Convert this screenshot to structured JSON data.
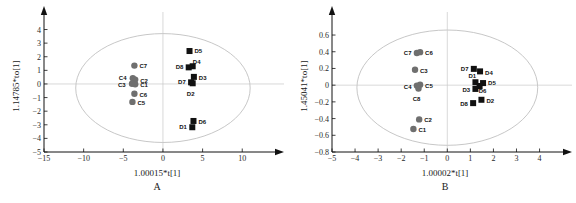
{
  "figure": {
    "faint_header": "",
    "background": "#ffffff"
  },
  "panels": [
    {
      "id": "A",
      "letter": "A",
      "xlabel": "1.00015*t[1]",
      "ylabel": "1.14785*to[1]",
      "xticks": [
        -15,
        -10,
        -5,
        0,
        5,
        10
      ],
      "yticks": [
        4,
        3,
        2,
        1,
        0,
        -1,
        -2,
        -3,
        -4,
        -5
      ],
      "xlim": [
        -15,
        13.5
      ],
      "ylim": [
        -5,
        4.7
      ],
      "ellipse": {
        "cx": 0,
        "cy": -0.3,
        "rx": 11.0,
        "ry": 4.0
      },
      "groups": [
        {
          "name": "C",
          "marker": "circle",
          "color": "#6f6f6f"
        },
        {
          "name": "D",
          "marker": "square",
          "color": "#111111"
        }
      ],
      "points": [
        {
          "label": "C7",
          "x": -3.6,
          "y": 1.35,
          "group": "C",
          "lbl_dx": 5,
          "lbl_dy": 2
        },
        {
          "label": "C4",
          "x": -3.8,
          "y": 0.42,
          "group": "C",
          "lbl_dx": -14,
          "lbl_dy": 2
        },
        {
          "label": "C2",
          "x": -3.5,
          "y": 0.32,
          "group": "C",
          "lbl_dx": 5,
          "lbl_dy": 3
        },
        {
          "label": "C3",
          "x": -3.9,
          "y": 0.02,
          "group": "C",
          "lbl_dx": -14,
          "lbl_dy": 3
        },
        {
          "label": "C1",
          "x": -3.5,
          "y": -0.02,
          "group": "C",
          "lbl_dx": 5,
          "lbl_dy": 3
        },
        {
          "label": "C6",
          "x": -3.6,
          "y": -0.72,
          "group": "C",
          "lbl_dx": 5,
          "lbl_dy": 3
        },
        {
          "label": "C5",
          "x": -3.85,
          "y": -1.32,
          "group": "C",
          "lbl_dx": 5,
          "lbl_dy": 3
        },
        {
          "label": "D5",
          "x": 3.35,
          "y": 2.42,
          "group": "D",
          "lbl_dx": 5,
          "lbl_dy": 2
        },
        {
          "label": "D8",
          "x": 3.25,
          "y": 1.22,
          "group": "D",
          "lbl_dx": -13,
          "lbl_dy": 2
        },
        {
          "label": "D4",
          "x": 3.75,
          "y": 1.3,
          "group": "D",
          "lbl_dx": 4,
          "lbl_dy": -2
        },
        {
          "label": "D3",
          "x": 3.9,
          "y": 0.52,
          "group": "D",
          "lbl_dx": 5,
          "lbl_dy": 3
        },
        {
          "label": "D7",
          "x": 3.55,
          "y": 0.12,
          "group": "D",
          "lbl_dx": -13,
          "lbl_dy": 2
        },
        {
          "label": "D2",
          "x": 3.75,
          "y": 0.05,
          "group": "D",
          "lbl_dx": -2,
          "lbl_dy": 13
        },
        {
          "label": "D6",
          "x": 3.85,
          "y": -2.72,
          "group": "D",
          "lbl_dx": 5,
          "lbl_dy": 3
        },
        {
          "label": "D1",
          "x": 3.7,
          "y": -3.18,
          "group": "D",
          "lbl_dx": -13,
          "lbl_dy": 2
        }
      ]
    },
    {
      "id": "B",
      "letter": "B",
      "xlabel": "1.00002*t[1]",
      "ylabel": "1.45041*to[1]",
      "xticks": [
        -5,
        -4,
        -3,
        -2,
        -1,
        0,
        1,
        2,
        3,
        4
      ],
      "yticks": [
        0.6,
        0.4,
        0.2,
        0,
        -0.2,
        -0.4,
        -0.6,
        -0.8
      ],
      "xlim": [
        -5,
        4.8
      ],
      "ylim": [
        -0.8,
        0.78
      ],
      "ellipse": {
        "cx": 0,
        "cy": -0.03,
        "rx": 3.92,
        "ry": 0.69
      },
      "groups": [
        {
          "name": "C",
          "marker": "circle",
          "color": "#6f6f6f"
        },
        {
          "name": "D",
          "marker": "square",
          "color": "#111111"
        }
      ],
      "points": [
        {
          "label": "C7",
          "x": -1.32,
          "y": 0.385,
          "group": "C",
          "lbl_dx": -13,
          "lbl_dy": 2
        },
        {
          "label": "C6",
          "x": -1.18,
          "y": 0.395,
          "group": "C",
          "lbl_dx": 5,
          "lbl_dy": 3
        },
        {
          "label": "C3",
          "x": -1.4,
          "y": 0.185,
          "group": "C",
          "lbl_dx": 5,
          "lbl_dy": 3
        },
        {
          "label": "C4",
          "x": -1.32,
          "y": -0.005,
          "group": "C",
          "lbl_dx": -13,
          "lbl_dy": 3
        },
        {
          "label": "C5",
          "x": -1.18,
          "y": 0.005,
          "group": "C",
          "lbl_dx": 5,
          "lbl_dy": 3
        },
        {
          "label": "C8",
          "x": -1.25,
          "y": -0.04,
          "group": "C",
          "lbl_dx": -2,
          "lbl_dy": 12
        },
        {
          "label": "C2",
          "x": -1.22,
          "y": -0.41,
          "group": "C",
          "lbl_dx": 5,
          "lbl_dy": 3
        },
        {
          "label": "C1",
          "x": -1.47,
          "y": -0.525,
          "group": "C",
          "lbl_dx": 5,
          "lbl_dy": 3
        },
        {
          "label": "D7",
          "x": 1.15,
          "y": 0.195,
          "group": "D",
          "lbl_dx": -13,
          "lbl_dy": 2
        },
        {
          "label": "D4",
          "x": 1.42,
          "y": 0.165,
          "group": "D",
          "lbl_dx": 5,
          "lbl_dy": 4
        },
        {
          "label": "D1",
          "x": 1.22,
          "y": 0.035,
          "group": "D",
          "lbl_dx": -7,
          "lbl_dy": -4
        },
        {
          "label": "D5",
          "x": 1.55,
          "y": 0.025,
          "group": "D",
          "lbl_dx": 5,
          "lbl_dy": 2
        },
        {
          "label": "D6",
          "x": 1.4,
          "y": -0.01,
          "group": "D",
          "lbl_dx": 3,
          "lbl_dy": 7
        },
        {
          "label": "D3",
          "x": 1.22,
          "y": -0.045,
          "group": "D",
          "lbl_dx": -13,
          "lbl_dy": 3
        },
        {
          "label": "D2",
          "x": 1.48,
          "y": -0.175,
          "group": "D",
          "lbl_dx": 5,
          "lbl_dy": 3
        },
        {
          "label": "D8",
          "x": 1.12,
          "y": -0.215,
          "group": "D",
          "lbl_dx": -13,
          "lbl_dy": 3
        }
      ]
    }
  ],
  "chart_data": {
    "type": "scatter",
    "title": "",
    "subplots": [
      {
        "panel": "A",
        "xlabel": "1.00015*t[1]",
        "ylabel": "1.14785*to[1]",
        "xlim": [
          -15,
          13.5
        ],
        "ylim": [
          -5,
          4.7
        ],
        "grid": false,
        "legend": "none",
        "annotation": "Hotelling T2 ellipse",
        "series": [
          {
            "name": "C group (control)",
            "marker": "circle",
            "color": "#6f6f6f",
            "points": [
              {
                "label": "C1",
                "x": -3.5,
                "y": -0.02
              },
              {
                "label": "C2",
                "x": -3.5,
                "y": 0.32
              },
              {
                "label": "C3",
                "x": -3.9,
                "y": 0.02
              },
              {
                "label": "C4",
                "x": -3.8,
                "y": 0.42
              },
              {
                "label": "C5",
                "x": -3.85,
                "y": -1.32
              },
              {
                "label": "C6",
                "x": -3.6,
                "y": -0.72
              },
              {
                "label": "C7",
                "x": -3.6,
                "y": 1.35
              }
            ]
          },
          {
            "name": "D group (model)",
            "marker": "square",
            "color": "#111111",
            "points": [
              {
                "label": "D1",
                "x": 3.7,
                "y": -3.18
              },
              {
                "label": "D2",
                "x": 3.75,
                "y": 0.05
              },
              {
                "label": "D3",
                "x": 3.9,
                "y": 0.52
              },
              {
                "label": "D4",
                "x": 3.75,
                "y": 1.3
              },
              {
                "label": "D5",
                "x": 3.35,
                "y": 2.42
              },
              {
                "label": "D6",
                "x": 3.85,
                "y": -2.72
              },
              {
                "label": "D7",
                "x": 3.55,
                "y": 0.12
              },
              {
                "label": "D8",
                "x": 3.25,
                "y": 1.22
              }
            ]
          }
        ]
      },
      {
        "panel": "B",
        "xlabel": "1.00002*t[1]",
        "ylabel": "1.45041*to[1]",
        "xlim": [
          -5,
          4.8
        ],
        "ylim": [
          -0.8,
          0.78
        ],
        "grid": false,
        "legend": "none",
        "annotation": "Hotelling T2 ellipse",
        "series": [
          {
            "name": "C group (control)",
            "marker": "circle",
            "color": "#6f6f6f",
            "points": [
              {
                "label": "C1",
                "x": -1.47,
                "y": -0.525
              },
              {
                "label": "C2",
                "x": -1.22,
                "y": -0.41
              },
              {
                "label": "C3",
                "x": -1.4,
                "y": 0.185
              },
              {
                "label": "C4",
                "x": -1.32,
                "y": -0.005
              },
              {
                "label": "C5",
                "x": -1.18,
                "y": 0.005
              },
              {
                "label": "C6",
                "x": -1.18,
                "y": 0.395
              },
              {
                "label": "C7",
                "x": -1.32,
                "y": 0.385
              },
              {
                "label": "C8",
                "x": -1.25,
                "y": -0.04
              }
            ]
          },
          {
            "name": "D group (model)",
            "marker": "square",
            "color": "#111111",
            "points": [
              {
                "label": "D1",
                "x": 1.22,
                "y": 0.035
              },
              {
                "label": "D2",
                "x": 1.48,
                "y": -0.175
              },
              {
                "label": "D3",
                "x": 1.22,
                "y": -0.045
              },
              {
                "label": "D4",
                "x": 1.42,
                "y": 0.165
              },
              {
                "label": "D5",
                "x": 1.55,
                "y": 0.025
              },
              {
                "label": "D6",
                "x": 1.4,
                "y": -0.01
              },
              {
                "label": "D7",
                "x": 1.15,
                "y": 0.195
              },
              {
                "label": "D8",
                "x": 1.12,
                "y": -0.215
              }
            ]
          }
        ]
      }
    ]
  }
}
